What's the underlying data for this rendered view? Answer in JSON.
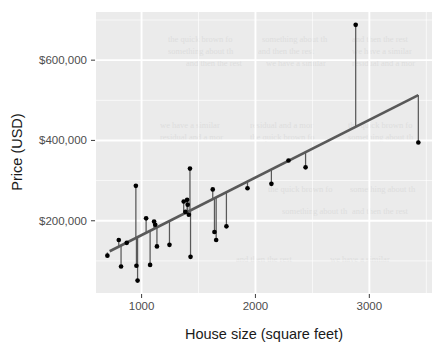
{
  "chart_data": {
    "type": "scatter",
    "title": "",
    "subtitle": "",
    "xlabel": "House size (square feet)",
    "ylabel": "Price (USD)",
    "xlim": [
      600,
      3550
    ],
    "ylim": [
      20000,
      720000
    ],
    "xticks": [
      1000,
      2000,
      3000
    ],
    "xtick_labels": [
      "1000",
      "2000",
      "3000"
    ],
    "yticks": [
      200000,
      400000,
      600000
    ],
    "ytick_labels": [
      "$200,000",
      "$400,000",
      "$600,000"
    ],
    "grid": true,
    "grid_major_color": "#ffffff",
    "panel_background": "#ebebeb",
    "legend": "none",
    "legend_position": "none",
    "point_color": "#000000",
    "point_size": 3.6,
    "residual_segment_color": "#595959",
    "fit_line": {
      "name": "regression line",
      "color": "#595959",
      "width": 2.6,
      "x_start": 720,
      "y_start": 124000,
      "x_end": 3430,
      "y_end": 513000
    },
    "series": [
      {
        "name": "Houses",
        "points": [
          {
            "x": 700,
            "y": 113000,
            "fit": 121000
          },
          {
            "x": 800,
            "y": 152000,
            "fit": 135000
          },
          {
            "x": 820,
            "y": 86000,
            "fit": 138000
          },
          {
            "x": 870,
            "y": 145000,
            "fit": 145000
          },
          {
            "x": 950,
            "y": 287000,
            "fit": 157000
          },
          {
            "x": 955,
            "y": 88000,
            "fit": 157000
          },
          {
            "x": 965,
            "y": 51000,
            "fit": 159000
          },
          {
            "x": 1040,
            "y": 206000,
            "fit": 170000
          },
          {
            "x": 1075,
            "y": 90000,
            "fit": 175000
          },
          {
            "x": 1110,
            "y": 198000,
            "fit": 180000
          },
          {
            "x": 1120,
            "y": 190000,
            "fit": 181000
          },
          {
            "x": 1135,
            "y": 136000,
            "fit": 183000
          },
          {
            "x": 1245,
            "y": 140000,
            "fit": 199000
          },
          {
            "x": 1370,
            "y": 248000,
            "fit": 217000
          },
          {
            "x": 1385,
            "y": 222000,
            "fit": 220000
          },
          {
            "x": 1400,
            "y": 252000,
            "fit": 222000
          },
          {
            "x": 1405,
            "y": 240000,
            "fit": 222000
          },
          {
            "x": 1415,
            "y": 215000,
            "fit": 224000
          },
          {
            "x": 1425,
            "y": 330000,
            "fit": 225000
          },
          {
            "x": 1430,
            "y": 110000,
            "fit": 226000
          },
          {
            "x": 1625,
            "y": 278000,
            "fit": 254000
          },
          {
            "x": 1640,
            "y": 172000,
            "fit": 256000
          },
          {
            "x": 1655,
            "y": 152000,
            "fit": 259000
          },
          {
            "x": 1745,
            "y": 186000,
            "fit": 271000
          },
          {
            "x": 1930,
            "y": 281000,
            "fit": 298000
          },
          {
            "x": 2140,
            "y": 292000,
            "fit": 328000
          },
          {
            "x": 2290,
            "y": 350000,
            "fit": 350000
          },
          {
            "x": 2440,
            "y": 333000,
            "fit": 371000
          },
          {
            "x": 2880,
            "y": 688000,
            "fit": 434000
          },
          {
            "x": 3430,
            "y": 395000,
            "fit": 513000
          }
        ]
      }
    ]
  },
  "background_artifact": {
    "description": "faint illegible document ghosting behind panel",
    "lines": [
      "the quick brown fox jumps over the lazy",
      "something about the regression fitting",
      "and then the rest of the text line here",
      "we have a similar point we will create the",
      "residual and a more robust estimate from"
    ]
  }
}
